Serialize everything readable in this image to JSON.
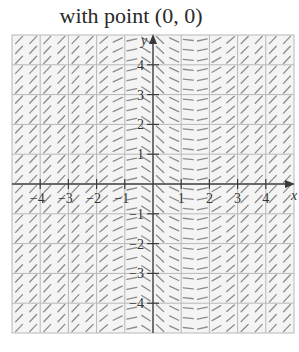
{
  "title": "with point (0, 0)",
  "chart_data": {
    "type": "slope-field",
    "title": "with point (0, 0)",
    "xlabel": "x",
    "ylabel": "y",
    "xlim": [
      -5,
      5
    ],
    "ylim": [
      -5,
      5
    ],
    "grid": true,
    "x_ticks": [
      -4,
      -3,
      -2,
      -1,
      1,
      2,
      3,
      4
    ],
    "y_ticks": [
      -4,
      -3,
      -2,
      -1,
      1,
      2,
      3,
      4
    ],
    "x_tick_labels": [
      "−4",
      "−3",
      "−2",
      "−1",
      "1",
      "2",
      "3",
      "4"
    ],
    "y_tick_labels": [
      "−4",
      "−3",
      "−2",
      "−1",
      "1",
      "2",
      "3",
      "4"
    ],
    "slope_depends_on": "x only",
    "segment_columns_x": [
      -4.75,
      -4.25,
      -3.75,
      -3.25,
      -2.75,
      -2.25,
      -1.75,
      -1.25,
      -0.75,
      -0.25,
      0.25,
      0.75,
      1.25,
      1.75,
      2.25,
      2.75,
      3.25,
      3.75,
      4.25,
      4.75
    ],
    "slopes": [
      1.0,
      1.0,
      1.0,
      1.0,
      1.0,
      0.95,
      0.8,
      0.45,
      0.2,
      -0.6,
      -0.9,
      -0.45,
      -0.1,
      0.2,
      0.55,
      0.8,
      0.95,
      1.0,
      1.0,
      1.0
    ],
    "segment_rows_per_unit": 3
  },
  "colors": {
    "grid": "#b8b8b8",
    "axis": "#3a3a3a",
    "segment": "#8c8c8c",
    "background": "#f4f4f4"
  }
}
